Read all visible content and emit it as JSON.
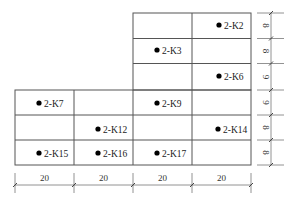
{
  "diagram": {
    "type": "column-grid-plan",
    "columns": [
      {
        "width_label": "20"
      },
      {
        "width_label": "20"
      },
      {
        "width_label": "20"
      },
      {
        "width_label": "20"
      }
    ],
    "rows": [
      {
        "height_label": "8"
      },
      {
        "height_label": "8"
      },
      {
        "height_label": "9"
      },
      {
        "height_label": "9"
      },
      {
        "height_label": "8"
      },
      {
        "height_label": "8"
      }
    ],
    "points": [
      {
        "id": "2-K2",
        "label": "2-K2"
      },
      {
        "id": "2-K3",
        "label": "2-K3"
      },
      {
        "id": "2-K6",
        "label": "2-K6"
      },
      {
        "id": "2-K7",
        "label": "2-K7"
      },
      {
        "id": "2-K9",
        "label": "2-K9"
      },
      {
        "id": "2-K12",
        "label": "2-K12"
      },
      {
        "id": "2-K14",
        "label": "2-K14"
      },
      {
        "id": "2-K15",
        "label": "2-K15"
      },
      {
        "id": "2-K16",
        "label": "2-K16"
      },
      {
        "id": "2-K17",
        "label": "2-K17"
      }
    ]
  }
}
